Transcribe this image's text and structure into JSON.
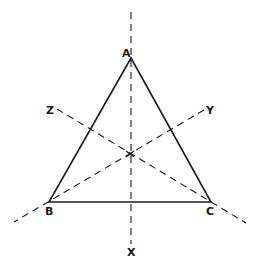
{
  "diagram": {
    "vertices": {
      "A": {
        "label": "A",
        "x": 131,
        "y": 58
      },
      "B": {
        "label": "B",
        "x": 49,
        "y": 202
      },
      "C": {
        "label": "C",
        "x": 211,
        "y": 202
      }
    },
    "centroid": {
      "x": 130,
      "y": 154
    },
    "axes": {
      "X": {
        "label": "X",
        "from": [
          131,
          12
        ],
        "to": [
          131,
          244
        ]
      },
      "Y": {
        "label": "Y",
        "from": [
          204,
          110
        ],
        "to": [
          14,
          222
        ]
      },
      "Z": {
        "label": "Z",
        "from": [
          57,
          109
        ],
        "to": [
          246,
          223
        ]
      }
    },
    "labels": {
      "A": "A",
      "B": "B",
      "C": "C",
      "X": "X",
      "Y": "Y",
      "Z": "Z"
    },
    "colors": {
      "stroke": "#1a1a1a",
      "background": "#ffffff"
    }
  }
}
